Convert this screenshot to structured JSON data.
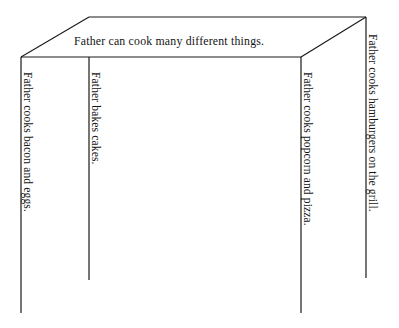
{
  "diagram": {
    "type": "open-box-outline",
    "title_text": "Father can cook many different things.",
    "background_color": "#ffffff",
    "line_color": "#1a1a1a",
    "panels": [
      {
        "id": "panel-1",
        "label": "Father cooks bacon and eggs."
      },
      {
        "id": "panel-2",
        "label": "Father bakes cakes."
      },
      {
        "id": "panel-3",
        "label": "Father cooks popcorn and pizza."
      },
      {
        "id": "panel-4",
        "label": "Father cooks hamburgers on the grill."
      }
    ],
    "geometry": {
      "front_top_left": "21,57",
      "front_top_right": "301,57",
      "back_top_left": "89,17",
      "back_top_right": "366,17",
      "front_left_bottom": "21,313",
      "divider_bottom": "89,280",
      "front_right_bottom": "301,313",
      "back_right_bottom": "366,278"
    }
  }
}
